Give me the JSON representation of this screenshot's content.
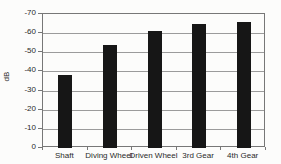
{
  "chart_data": {
    "type": "bar",
    "title": "",
    "categories": [
      "Shaft",
      "Diving Wheel",
      "Driven Wheel",
      "3rd Gear",
      "4th Gear"
    ],
    "values": [
      -38,
      -54,
      -61,
      -65,
      -66
    ],
    "xlabel": "",
    "ylabel": "dB",
    "ylim": [
      0,
      -70
    ],
    "yticks": [
      "-70",
      "-60",
      "-50",
      "-40",
      "-30",
      "-20",
      "-10",
      "0"
    ],
    "grid": true,
    "legend": "none",
    "bar_color": "#161616",
    "grid_color": "#9b9b9b",
    "axis_color": "#777777",
    "background_color": "#fcfcfb"
  }
}
